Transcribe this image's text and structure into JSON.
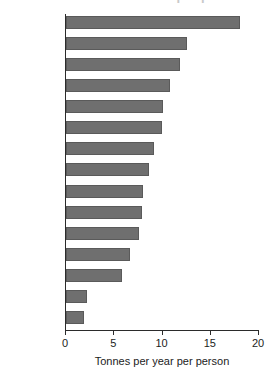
{
  "chart_data": {
    "type": "bar",
    "orientation": "horizontal",
    "title": "",
    "xlabel": "Tonnes per year per person",
    "ylabel": "",
    "xlim": [
      0,
      20
    ],
    "xticks": [
      0,
      5,
      10,
      15,
      20
    ],
    "xtick_labels": [
      "0",
      "5",
      "10",
      "15",
      "20"
    ],
    "grid": false,
    "legend": null,
    "bar_color": "#6f6f6f",
    "bar_edge_color": "#5a5a5a",
    "axis_color": "#2b2b2b",
    "categories": [
      "US",
      "Russia",
      "Czech Rep.",
      "Netherlands",
      "Germany",
      "Japan",
      "UK",
      "Poland",
      "Italy",
      "Spain",
      "France",
      "Sweden",
      "China",
      "Brazil",
      "India"
    ],
    "values": [
      18.0,
      12.5,
      11.8,
      10.8,
      10.0,
      9.9,
      9.1,
      8.6,
      8.0,
      7.9,
      7.6,
      6.6,
      5.8,
      2.2,
      1.9
    ]
  },
  "axis": {
    "x_title": "Tonnes per year per person"
  },
  "header": {
    "clipped_title": "Carbon dioxide emissions per person"
  }
}
